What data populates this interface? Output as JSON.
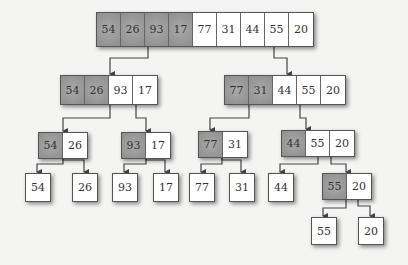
{
  "diagram": {
    "colors": {
      "shaded": "#8e8e8e",
      "plain": "#ffffff",
      "border": "#555555",
      "background": "#f4f4f2"
    },
    "nodes": [
      {
        "id": "root",
        "x": 96,
        "y": 12,
        "h": 33,
        "values": [
          "54",
          "26",
          "93",
          "17",
          "77",
          "31",
          "44",
          "55",
          "20"
        ],
        "shaded": 4
      },
      {
        "id": "l",
        "x": 60,
        "y": 75,
        "h": 28,
        "values": [
          "54",
          "26",
          "93",
          "17"
        ],
        "shaded": 2
      },
      {
        "id": "r",
        "x": 224,
        "y": 75,
        "h": 28,
        "values": [
          "77",
          "31",
          "44",
          "55",
          "20"
        ],
        "shaded": 2
      },
      {
        "id": "ll",
        "x": 38,
        "y": 132,
        "h": 25,
        "values": [
          "54",
          "26"
        ],
        "shaded": 1
      },
      {
        "id": "lr",
        "x": 121,
        "y": 132,
        "h": 25,
        "values": [
          "93",
          "17"
        ],
        "shaded": 1
      },
      {
        "id": "rl",
        "x": 198,
        "y": 131,
        "h": 25,
        "values": [
          "77",
          "31"
        ],
        "shaded": 1
      },
      {
        "id": "rr",
        "x": 281,
        "y": 130,
        "h": 25,
        "values": [
          "44",
          "55",
          "20"
        ],
        "shaded": 1
      },
      {
        "id": "lll",
        "x": 25,
        "y": 173,
        "h": 27,
        "values": [
          "54"
        ],
        "shaded": 0
      },
      {
        "id": "llr",
        "x": 72,
        "y": 173,
        "h": 27,
        "values": [
          "26"
        ],
        "shaded": 0
      },
      {
        "id": "lrl",
        "x": 112,
        "y": 173,
        "h": 27,
        "values": [
          "93"
        ],
        "shaded": 0
      },
      {
        "id": "lrr",
        "x": 153,
        "y": 173,
        "h": 27,
        "values": [
          "17"
        ],
        "shaded": 0
      },
      {
        "id": "rll",
        "x": 189,
        "y": 173,
        "h": 27,
        "values": [
          "77"
        ],
        "shaded": 0
      },
      {
        "id": "rlr",
        "x": 229,
        "y": 173,
        "h": 27,
        "values": [
          "31"
        ],
        "shaded": 0
      },
      {
        "id": "rrl",
        "x": 268,
        "y": 173,
        "h": 27,
        "values": [
          "44"
        ],
        "shaded": 0
      },
      {
        "id": "rrr",
        "x": 322,
        "y": 173,
        "h": 25,
        "values": [
          "55",
          "20"
        ],
        "shaded": 1
      },
      {
        "id": "rrrl",
        "x": 311,
        "y": 217,
        "h": 26,
        "values": [
          "55"
        ],
        "shaded": 0
      },
      {
        "id": "rrrr",
        "x": 358,
        "y": 217,
        "h": 26,
        "values": [
          "20"
        ],
        "shaded": 0
      }
    ],
    "edges": [
      [
        148,
        45,
        148,
        58,
        110,
        58,
        110,
        74
      ],
      [
        274,
        45,
        274,
        58,
        287,
        58,
        287,
        74
      ],
      [
        110,
        103,
        110,
        118,
        63,
        118,
        63,
        131
      ],
      [
        136,
        103,
        136,
        118,
        146,
        118,
        146,
        131
      ],
      [
        249,
        103,
        249,
        118,
        210,
        118,
        210,
        130
      ],
      [
        300,
        103,
        300,
        118,
        306,
        118,
        306,
        129
      ],
      [
        63,
        157,
        63,
        164,
        37,
        164,
        37,
        172
      ],
      [
        63,
        157,
        63,
        160,
        84,
        160,
        84,
        172
      ],
      [
        146,
        157,
        146,
        164,
        124,
        164,
        124,
        172
      ],
      [
        146,
        157,
        146,
        160,
        165,
        160,
        165,
        172
      ],
      [
        222,
        156,
        222,
        164,
        201,
        164,
        201,
        172
      ],
      [
        222,
        156,
        222,
        160,
        241,
        160,
        241,
        172
      ],
      [
        318,
        155,
        318,
        164,
        280,
        164,
        280,
        172
      ],
      [
        331,
        155,
        331,
        164,
        346,
        164,
        346,
        172
      ],
      [
        346,
        198,
        346,
        208,
        323,
        208,
        323,
        216
      ],
      [
        358,
        198,
        358,
        206,
        370,
        206,
        370,
        216
      ]
    ]
  }
}
